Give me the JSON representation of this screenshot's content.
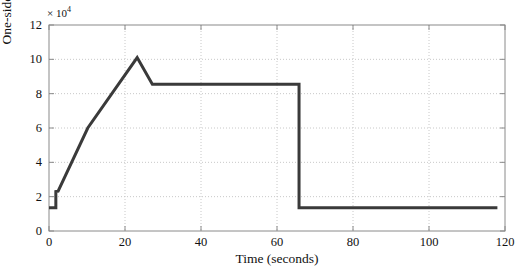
{
  "chart_data": {
    "type": "line",
    "title": "",
    "xlabel": "Time (seconds)",
    "ylabel": "One-sided Track Resistance (N)",
    "y_exponent_label": "× 10",
    "y_exponent_power": "4",
    "y_scale_factor": 10000,
    "xlim": [
      0,
      120
    ],
    "ylim": [
      0,
      12
    ],
    "xticks": [
      0,
      20,
      40,
      60,
      80,
      100,
      120
    ],
    "xtick_labels": [
      "0",
      "20",
      "40",
      "60",
      "80",
      "100",
      "120"
    ],
    "yticks": [
      0,
      2,
      4,
      6,
      8,
      10,
      12
    ],
    "ytick_labels": [
      "0",
      "2",
      "4",
      "6",
      "8",
      "10",
      "12"
    ],
    "grid": true,
    "grid_style": "dotted",
    "grid_color": "#c8c8c8",
    "legend": null,
    "axis_color": "#8a8a8a",
    "tick_direction": "in",
    "series": [
      {
        "name": "One-sided Track Resistance",
        "color": "#3a3a3a",
        "line_width": 3,
        "x": [
          0,
          1.8,
          1.8,
          2.4,
          10.2,
          23.2,
          27.2,
          65.8,
          65.8,
          118
        ],
        "y": [
          1.35,
          1.35,
          2.3,
          2.32,
          6.0,
          10.1,
          8.55,
          8.55,
          1.35,
          1.35
        ]
      }
    ],
    "annotations": [
      {
        "label": "initial-plateau",
        "value": 1.35
      },
      {
        "label": "step-up",
        "value": 2.3,
        "x": 1.8
      },
      {
        "label": "peak",
        "value": 10.1,
        "x": 23.2
      },
      {
        "label": "mid-plateau",
        "value": 8.55
      },
      {
        "label": "drop-time",
        "x": 65.8
      },
      {
        "label": "final-plateau",
        "value": 1.35
      }
    ]
  }
}
